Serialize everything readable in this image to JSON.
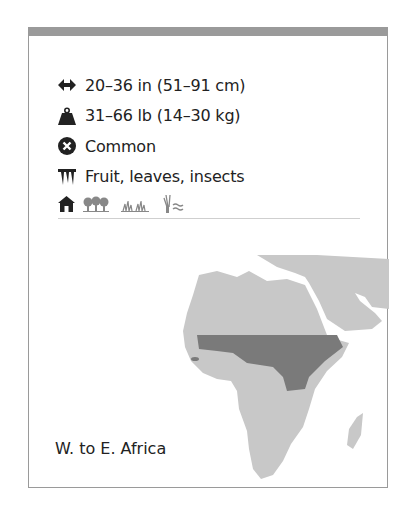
{
  "card": {
    "accent_color": "#9a9a9a",
    "stats": [
      {
        "icon": "length-arrows-icon",
        "text": "20–36 in (51–91 cm)"
      },
      {
        "icon": "weight-icon",
        "text": "31–66 lb (14–30 kg)"
      },
      {
        "icon": "status-x-icon",
        "text": "Common"
      },
      {
        "icon": "diet-teeth-icon",
        "text": "Fruit, leaves, insects"
      }
    ],
    "habitats": [
      "house-icon",
      "forest-icon",
      "grassland-icon",
      "wetland-icon"
    ],
    "map": {
      "region_label": "W. to E. Africa",
      "land_color": "#c8c8c8",
      "range_color": "#7a7a7a"
    }
  }
}
